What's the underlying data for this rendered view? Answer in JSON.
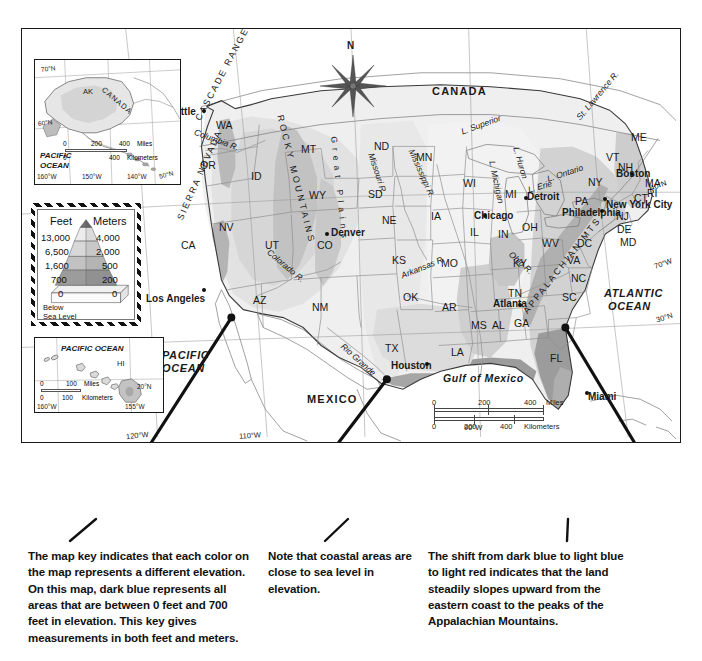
{
  "map": {
    "title_absent": true,
    "compass": {
      "label": "N",
      "name": "compass-rose"
    },
    "countries": [
      {
        "label": "CANADA",
        "x": 432,
        "y": 90
      },
      {
        "label": "MEXICO",
        "x": 307,
        "y": 400
      }
    ],
    "oceans": [
      {
        "label_line1": "PACIFIC",
        "label_line2": "OCEAN",
        "x": 162,
        "y": 356
      },
      {
        "label_line1": "ATLANTIC",
        "label_line2": "OCEAN",
        "x": 607,
        "y": 295
      },
      {
        "label": "Gulf of Mexico",
        "x": 449,
        "y": 379
      }
    ],
    "regions": [
      {
        "label": "CASCADE RANGE",
        "name": "cascade-range"
      },
      {
        "label": "SIERRA NEVADA",
        "name": "sierra-nevada"
      },
      {
        "label": "ROCKY MOUNTAINS",
        "name": "rocky-mountains"
      },
      {
        "label": "APPALACHIAN MTS.",
        "name": "appalachian-mountains"
      },
      {
        "label": "Great Plains",
        "name": "great-plains"
      }
    ],
    "waters": [
      {
        "label": "Columbia R.",
        "x": 216,
        "y": 133
      },
      {
        "label": "Colorado R.",
        "x": 287,
        "y": 255
      },
      {
        "label": "Missouri R.",
        "x": 382,
        "y": 168
      },
      {
        "label": "Mississippi R.",
        "x": 418,
        "y": 160
      },
      {
        "label": "Arkansas R.",
        "x": 412,
        "y": 272
      },
      {
        "label": "Ohio R.",
        "x": 519,
        "y": 256
      },
      {
        "label": "Rio Grande",
        "x": 357,
        "y": 353
      },
      {
        "label": "L. Superior",
        "x": 468,
        "y": 133
      },
      {
        "label": "L. Michigan",
        "x": 495,
        "y": 168
      },
      {
        "label": "L. Huron",
        "x": 521,
        "y": 152
      },
      {
        "label": "L. Erie",
        "x": 533,
        "y": 189
      },
      {
        "label": "L. Ontario",
        "x": 555,
        "y": 176
      },
      {
        "label": "St. Lawrence R.",
        "x": 583,
        "y": 120
      }
    ],
    "states": [
      {
        "label": "WA",
        "x": 216,
        "y": 120
      },
      {
        "label": "OR",
        "x": 200,
        "y": 160
      },
      {
        "label": "CA",
        "x": 181,
        "y": 240
      },
      {
        "label": "NV",
        "x": 219,
        "y": 222
      },
      {
        "label": "ID",
        "x": 251,
        "y": 171
      },
      {
        "label": "MT",
        "x": 301,
        "y": 144
      },
      {
        "label": "WY",
        "x": 309,
        "y": 190
      },
      {
        "label": "UT",
        "x": 265,
        "y": 240
      },
      {
        "label": "CO",
        "x": 317,
        "y": 240
      },
      {
        "label": "AZ",
        "x": 253,
        "y": 295
      },
      {
        "label": "NM",
        "x": 312,
        "y": 302
      },
      {
        "label": "ND",
        "x": 374,
        "y": 141
      },
      {
        "label": "SD",
        "x": 368,
        "y": 189
      },
      {
        "label": "NE",
        "x": 382,
        "y": 215
      },
      {
        "label": "KS",
        "x": 392,
        "y": 255
      },
      {
        "label": "OK",
        "x": 403,
        "y": 292
      },
      {
        "label": "TX",
        "x": 385,
        "y": 343
      },
      {
        "label": "MN",
        "x": 416,
        "y": 152
      },
      {
        "label": "IA",
        "x": 431,
        "y": 211
      },
      {
        "label": "MO",
        "x": 441,
        "y": 258
      },
      {
        "label": "AR",
        "x": 442,
        "y": 302
      },
      {
        "label": "LA",
        "x": 451,
        "y": 347
      },
      {
        "label": "MS",
        "x": 471,
        "y": 320
      },
      {
        "label": "AL",
        "x": 492,
        "y": 320
      },
      {
        "label": "GA",
        "x": 514,
        "y": 318
      },
      {
        "label": "FL",
        "x": 550,
        "y": 353
      },
      {
        "label": "WI",
        "x": 463,
        "y": 178
      },
      {
        "label": "IL",
        "x": 470,
        "y": 227
      },
      {
        "label": "IN",
        "x": 498,
        "y": 229
      },
      {
        "label": "MI",
        "x": 505,
        "y": 189
      },
      {
        "label": "OH",
        "x": 522,
        "y": 222
      },
      {
        "label": "KY",
        "x": 513,
        "y": 258
      },
      {
        "label": "TN",
        "x": 508,
        "y": 288
      },
      {
        "label": "WV",
        "x": 542,
        "y": 238
      },
      {
        "label": "VA",
        "x": 567,
        "y": 255
      },
      {
        "label": "NC",
        "x": 571,
        "y": 273
      },
      {
        "label": "SC",
        "x": 562,
        "y": 292
      },
      {
        "label": "PA",
        "x": 575,
        "y": 196
      },
      {
        "label": "NY",
        "x": 588,
        "y": 177
      },
      {
        "label": "VT",
        "x": 606,
        "y": 152
      },
      {
        "label": "NH",
        "x": 618,
        "y": 162
      },
      {
        "label": "ME",
        "x": 631,
        "y": 132
      },
      {
        "label": "MA",
        "x": 645,
        "y": 178
      },
      {
        "label": "RI",
        "x": 647,
        "y": 188
      },
      {
        "label": "CT",
        "x": 634,
        "y": 193
      },
      {
        "label": "NJ",
        "x": 616,
        "y": 211
      },
      {
        "label": "DE",
        "x": 617,
        "y": 224
      },
      {
        "label": "MD",
        "x": 620,
        "y": 237
      },
      {
        "label": "DC",
        "x": 577,
        "y": 238
      }
    ],
    "cities": [
      {
        "label": "Seattle",
        "lx": 163,
        "ly": 107,
        "dx": 202,
        "dy": 109
      },
      {
        "label": "Los Angeles",
        "lx": 146,
        "ly": 294,
        "dx": 202,
        "dy": 288
      },
      {
        "label": "Denver",
        "lx": 331,
        "ly": 228,
        "dx": 325,
        "dy": 232
      },
      {
        "label": "Chicago",
        "lx": 474,
        "ly": 211,
        "dx": 483,
        "dy": 214
      },
      {
        "label": "Houston",
        "lx": 391,
        "ly": 361,
        "dx": 425,
        "dy": 362
      },
      {
        "label": "Atlanta",
        "lx": 493,
        "ly": 299,
        "dx": 518,
        "dy": 303
      },
      {
        "label": "Detroit",
        "lx": 527,
        "ly": 192,
        "dx": 524,
        "dy": 196
      },
      {
        "label": "Philadelphia",
        "lx": 562,
        "ly": 208,
        "dx": 600,
        "dy": 209
      },
      {
        "label": "New York City",
        "lx": 606,
        "ly": 200,
        "dx": 603,
        "dy": 197
      },
      {
        "label": "Boston",
        "lx": 616,
        "ly": 169,
        "dx": 630,
        "dy": 172
      },
      {
        "label": "Miami",
        "lx": 588,
        "ly": 392,
        "dx": 585,
        "dy": 391
      }
    ],
    "coordinates": [
      {
        "label": "120°W",
        "x": 137,
        "y": 437
      },
      {
        "label": "110°W",
        "x": 250,
        "y": 437
      },
      {
        "label": "90°W",
        "x": 472,
        "y": 429
      },
      {
        "label": "70°W",
        "x": 666,
        "y": 266
      },
      {
        "label": "40°N",
        "x": 660,
        "y": 186
      },
      {
        "label": "30°N",
        "x": 666,
        "y": 320
      }
    ],
    "scale": {
      "name": "map-scale-bar",
      "miles": {
        "ticks": [
          "0",
          "200",
          "400"
        ],
        "unit": "Miles"
      },
      "kilometers": {
        "ticks": [
          "0",
          "200",
          "400"
        ],
        "unit": "Kilometers"
      }
    }
  },
  "insets": {
    "alaska": {
      "name": "alaska-inset",
      "labels": [
        {
          "label": "AK",
          "x": 56,
          "y": 92
        },
        {
          "label": "CANADA",
          "x": 109,
          "y": 93
        },
        {
          "label": "PACIFIC",
          "x": 42,
          "y": 158
        },
        {
          "label": "OCEAN",
          "x": 42,
          "y": 167
        },
        {
          "label": "70°N",
          "x": 42,
          "y": 69
        },
        {
          "label": "60°N",
          "x": 38,
          "y": 126
        },
        {
          "label": "50°N",
          "x": 161,
          "y": 176
        },
        {
          "label": "160°W",
          "x": 38,
          "y": 178
        },
        {
          "label": "150°W",
          "x": 83,
          "y": 178
        },
        {
          "label": "140°W",
          "x": 127,
          "y": 178
        }
      ],
      "scale": {
        "miles": {
          "ticks": [
            "0",
            "200",
            "400"
          ],
          "unit": "Miles"
        },
        "kilometers": {
          "ticks": [
            "0",
            "400"
          ],
          "unit": "Kilometers"
        }
      }
    },
    "hawaii": {
      "name": "hawaii-inset",
      "labels": [
        {
          "label": "PACIFIC OCEAN",
          "x": 62,
          "y": 347
        },
        {
          "label": "HI",
          "x": 117,
          "y": 361
        },
        {
          "label": "20°N",
          "x": 136,
          "y": 387
        },
        {
          "label": "160°W",
          "x": 38,
          "y": 404
        },
        {
          "label": "155°W",
          "x": 125,
          "y": 404
        }
      ],
      "scale": {
        "miles": {
          "ticks": [
            "0",
            "100"
          ],
          "unit": "Miles"
        },
        "kilometers": {
          "ticks": [
            "0",
            "100"
          ],
          "unit": "Kilometers"
        }
      }
    }
  },
  "key": {
    "name": "elevation-key",
    "header_feet": "Feet",
    "header_meters": "Meters",
    "rows": [
      {
        "feet": "13,000",
        "meters": "4,000"
      },
      {
        "feet": "6,500",
        "meters": "2,000"
      },
      {
        "feet": "1,600",
        "meters": "500"
      },
      {
        "feet": "700",
        "meters": "200"
      },
      {
        "feet": "0",
        "meters": "0"
      }
    ],
    "below_line1": "Below",
    "below_line2": "Sea Level"
  },
  "captions": {
    "key_note": "The map key indicates that each color on the map represents a different elevation. On this map, dark blue represents all areas that are between 0 feet and 700 feet in elevation. This key gives measurements in both feet and meters.",
    "coastal_note": "Note that coastal areas are close to sea level in elevation.",
    "slope_note": "The shift from dark blue to light blue to light red indicates that the land steadily slopes upward from the eastern coast to the peaks of the Appalachian Mountains."
  },
  "colors": {
    "elev_0_700": "#9a9a9a",
    "elev_700_1600": "#c4c4c4",
    "elev_1600_6500": "#d8d8d8",
    "elev_6500_13000": "#ececec",
    "border": "#1a1a1a",
    "water_line": "#8a8a8a",
    "leader_line": "#111111"
  }
}
